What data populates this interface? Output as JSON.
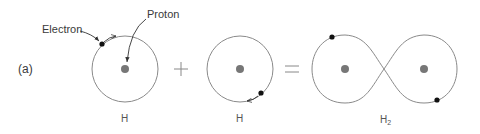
{
  "figure": {
    "panel_label": "(a)",
    "callouts": {
      "electron": "Electron",
      "proton": "Proton"
    },
    "operators": {
      "plus": "+",
      "equals": "="
    },
    "atoms": [
      {
        "id": "hydrogen-1",
        "label": "H",
        "subscript": ""
      },
      {
        "id": "hydrogen-2",
        "label": "H",
        "subscript": ""
      },
      {
        "id": "hydrogen-molecule",
        "label": "H",
        "subscript": "2"
      }
    ]
  },
  "colors": {
    "orbit": "#8a8a8a",
    "proton": "#777777",
    "electron": "#111111",
    "text": "#3a3a3a"
  }
}
